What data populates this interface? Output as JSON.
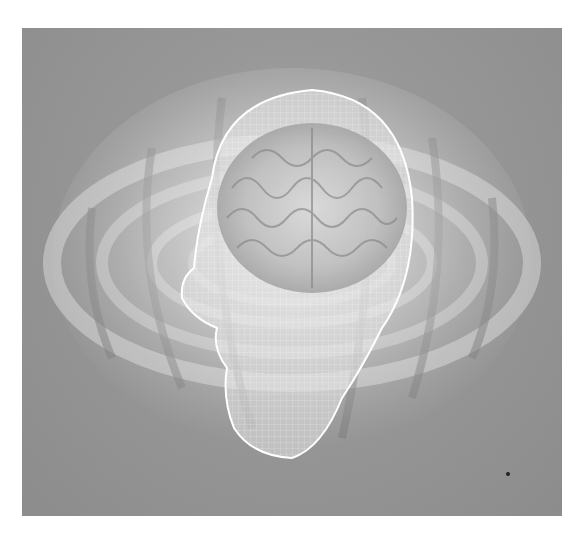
{
  "image": {
    "subject": "wireframe-head-with-brain",
    "background_color": "#979797",
    "frame": {
      "x": 22,
      "y": 28,
      "width": 540,
      "height": 488
    }
  }
}
